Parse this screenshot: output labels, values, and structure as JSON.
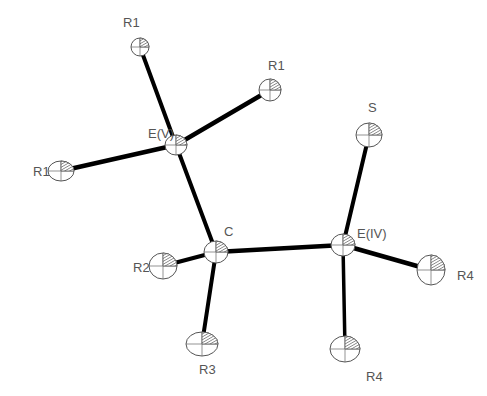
{
  "diagram": {
    "type": "ORTEP molecular structure",
    "colors": {
      "bond": "#000000",
      "outline": "#555555",
      "label": "#555555",
      "background": "#ffffff"
    },
    "atoms": [
      {
        "id": "EV",
        "label": "E(V)",
        "x": 176,
        "y": 145,
        "rx": 11,
        "ry": 10,
        "label_x": 148,
        "label_y": 138
      },
      {
        "id": "R1a",
        "label": "R1",
        "x": 140,
        "y": 47,
        "rx": 9,
        "ry": 9,
        "label_x": 123,
        "label_y": 27
      },
      {
        "id": "R1b",
        "label": "R1",
        "x": 270,
        "y": 90,
        "rx": 11,
        "ry": 11,
        "label_x": 268,
        "label_y": 70
      },
      {
        "id": "R1c",
        "label": "R1",
        "x": 61,
        "y": 171,
        "rx": 13,
        "ry": 10,
        "label_x": 33,
        "label_y": 176
      },
      {
        "id": "C",
        "label": "C",
        "x": 216,
        "y": 252,
        "rx": 12,
        "ry": 11,
        "label_x": 224,
        "label_y": 236
      },
      {
        "id": "EIV",
        "label": "E(IV)",
        "x": 343,
        "y": 245,
        "rx": 12,
        "ry": 11,
        "label_x": 357,
        "label_y": 238
      },
      {
        "id": "S",
        "label": "S",
        "x": 369,
        "y": 135,
        "rx": 13,
        "ry": 12,
        "label_x": 368,
        "label_y": 112
      },
      {
        "id": "R2",
        "label": "R2",
        "x": 163,
        "y": 266,
        "rx": 14,
        "ry": 13,
        "label_x": 133,
        "label_y": 272
      },
      {
        "id": "R3",
        "label": "R3",
        "x": 202,
        "y": 344,
        "rx": 16,
        "ry": 12,
        "label_x": 199,
        "label_y": 374
      },
      {
        "id": "R4a",
        "label": "R4",
        "x": 431,
        "y": 270,
        "rx": 14,
        "ry": 15,
        "label_x": 457,
        "label_y": 280
      },
      {
        "id": "R4b",
        "label": "R4",
        "x": 345,
        "y": 349,
        "rx": 15,
        "ry": 13,
        "label_x": 366,
        "label_y": 381
      }
    ],
    "bonds": [
      {
        "from": "EV",
        "to": "R1a",
        "width": 4
      },
      {
        "from": "EV",
        "to": "R1b",
        "width": 4.5
      },
      {
        "from": "EV",
        "to": "R1c",
        "width": 4.5
      },
      {
        "from": "EV",
        "to": "C",
        "width": 4
      },
      {
        "from": "C",
        "to": "R2",
        "width": 4
      },
      {
        "from": "C",
        "to": "R3",
        "width": 4
      },
      {
        "from": "C",
        "to": "EIV",
        "width": 4.5
      },
      {
        "from": "EIV",
        "to": "S",
        "width": 4
      },
      {
        "from": "EIV",
        "to": "R4a",
        "width": 4.5
      },
      {
        "from": "EIV",
        "to": "R4b",
        "width": 3.5
      }
    ]
  }
}
